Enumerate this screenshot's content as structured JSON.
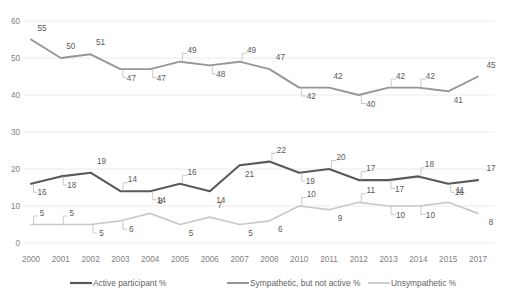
{
  "chart_data": {
    "type": "line",
    "title": "",
    "subtitle": "",
    "xlabel": "",
    "ylabel": "",
    "ylim": [
      0,
      60
    ],
    "ytick_step": 10,
    "yticks": [
      "0",
      "10",
      "20",
      "30",
      "40",
      "50",
      "60"
    ],
    "grid": "horizontal",
    "legend_position": "bottom",
    "categories": [
      "2000",
      "2001",
      "2002",
      "2003",
      "2004",
      "2005",
      "2006",
      "2007",
      "2008",
      "2010",
      "2011",
      "2012",
      "2013",
      "2014",
      "2015",
      "2017"
    ],
    "series": [
      {
        "name": "Active participant %",
        "color": "#595959",
        "width": 2.1,
        "values": [
          16,
          18,
          19,
          14,
          14,
          16,
          14,
          21,
          22,
          19,
          20,
          17,
          17,
          18,
          16,
          17
        ]
      },
      {
        "name": "Sympathetic, but not active %",
        "color": "#969696",
        "width": 1.9,
        "values": [
          55,
          50,
          51,
          47,
          47,
          49,
          48,
          49,
          47,
          42,
          42,
          40,
          42,
          42,
          41,
          45
        ]
      },
      {
        "name": "Unsympathetic %",
        "color": "#c9c9c9",
        "width": 1.7,
        "values": [
          5,
          5,
          5,
          6,
          8,
          5,
          7,
          5,
          6,
          10,
          9,
          11,
          10,
          10,
          11,
          8
        ]
      }
    ]
  },
  "legend": {
    "items": [
      {
        "label": "Active participant %",
        "color": "#595959"
      },
      {
        "label": "Sympathetic, but not active %",
        "color": "#969696"
      },
      {
        "label": "Unsympathetic %",
        "color": "#c9c9c9"
      }
    ]
  },
  "labels": {
    "active": [
      "16",
      "18",
      "19",
      "14",
      "14",
      "16",
      "14",
      "21",
      "22",
      "19",
      "20",
      "17",
      "17",
      "18",
      "16",
      "17"
    ],
    "sympathetic": [
      "55",
      "50",
      "51",
      "47",
      "47",
      "49",
      "48",
      "49",
      "47",
      "42",
      "42",
      "40",
      "42",
      "42",
      "41",
      "45"
    ],
    "unsympathetic": [
      "5",
      "5",
      "5",
      "6",
      "8",
      "5",
      "7",
      "5",
      "6",
      "10",
      "9",
      "11",
      "10",
      "10",
      "11",
      "8"
    ]
  }
}
